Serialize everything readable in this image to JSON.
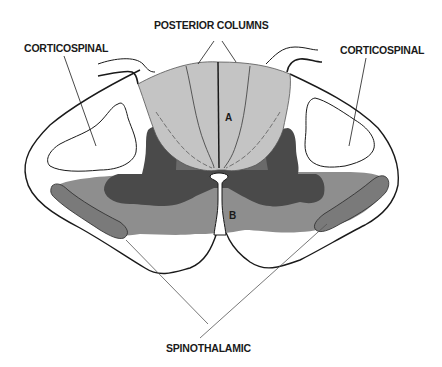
{
  "diagram": {
    "type": "anatomical cross-section",
    "labels": {
      "posterior_columns": "POSTERIOR COLUMNS",
      "corticospinal_left": "CORTICOSPINAL",
      "corticospinal_right": "CORTICOSPINAL",
      "spinothalamic": "SPINOTHALAMIC",
      "region_a": "A",
      "region_b": "B"
    },
    "colors": {
      "background": "#ffffff",
      "outline": "#1a1a1a",
      "posterior_columns_fill": "#c4c4c4",
      "gray_matter_dark": "#4a4a4a",
      "anterior_region_fill": "#8e8e8e",
      "spinothalamic_tract_fill": "#7a7a7a",
      "leader_line": "#555555"
    }
  }
}
